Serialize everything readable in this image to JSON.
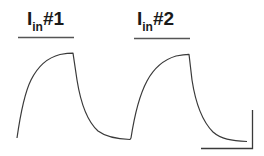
{
  "figure": {
    "stimuli": [
      {
        "main": "I",
        "sub": "in",
        "suffix": "#1"
      },
      {
        "main": "I",
        "sub": "in",
        "suffix": "#2"
      }
    ],
    "colors": {
      "line": "#3a3a3a",
      "text": "#1a1a1a",
      "background": "#ffffff"
    },
    "scale_bar": {
      "horizontal_label": "",
      "vertical_label": ""
    }
  }
}
